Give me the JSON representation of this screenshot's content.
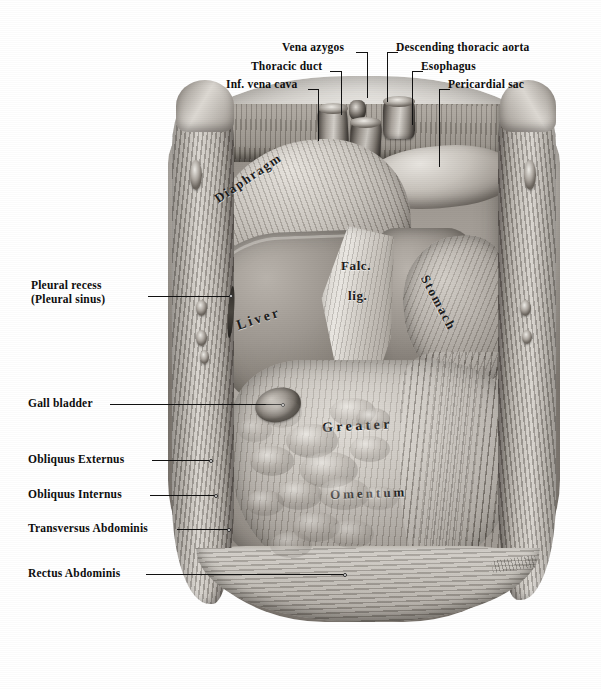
{
  "plate": {
    "title": "Abdominal cavity, anterior view with body wall reflected",
    "medium": "halftone anatomical engraving",
    "background_color": "#ffffff",
    "ink_color": "#111111"
  },
  "callouts": [
    {
      "id": "vena-azygos",
      "text": "Vena azygos",
      "align": "right",
      "x": 282,
      "y": 40,
      "lead": {
        "h_x": 356,
        "h_y": 52,
        "h_w": 12,
        "v_x": 367,
        "v_y": 52,
        "v_h": 46
      }
    },
    {
      "id": "thoracic-duct",
      "text": "Thoracic duct",
      "align": "right",
      "x": 251,
      "y": 59,
      "lead": {
        "h_x": 330,
        "h_y": 71,
        "h_w": 12,
        "v_x": 341,
        "v_y": 71,
        "v_h": 44
      }
    },
    {
      "id": "inf-vena-cava",
      "text": "Inf. vena cava",
      "align": "right",
      "x": 226,
      "y": 77,
      "lead": {
        "h_x": 308,
        "h_y": 89,
        "h_w": 11,
        "v_x": 318,
        "v_y": 89,
        "v_h": 52
      }
    },
    {
      "id": "descending-thoracic-aorta",
      "text": "Descending thoracic aorta",
      "align": "left",
      "x": 396,
      "y": 40,
      "lead": {
        "h_x": 387,
        "h_y": 52,
        "h_w": 11,
        "v_x": 387,
        "v_y": 52,
        "v_h": 50
      }
    },
    {
      "id": "esophagus",
      "text": "Esophagus",
      "align": "left",
      "x": 421,
      "y": 59,
      "lead": {
        "h_x": 412,
        "h_y": 71,
        "h_w": 11,
        "v_x": 412,
        "v_y": 71,
        "v_h": 54
      }
    },
    {
      "id": "pericardial-sac",
      "text": "Pericardial sac",
      "align": "left",
      "x": 448,
      "y": 77,
      "lead": {
        "h_x": 439,
        "h_y": 89,
        "h_w": 11,
        "v_x": 439,
        "v_y": 89,
        "v_h": 78
      }
    },
    {
      "id": "pleural-recess",
      "text": "Pleural recess\n(Pleural sinus)",
      "align": "right",
      "x": 31,
      "y": 278,
      "lead": {
        "h_x": 148,
        "h_y": 296,
        "h_w": 82,
        "dot_x": 229,
        "dot_y": 294
      }
    },
    {
      "id": "gall-bladder",
      "text": "Gall bladder",
      "align": "right",
      "x": 28,
      "y": 396,
      "lead": {
        "h_x": 110,
        "h_y": 404,
        "h_w": 172,
        "dot_x": 281,
        "dot_y": 403
      }
    },
    {
      "id": "obliquus-externus",
      "text": "Obliquus Externus",
      "align": "right",
      "x": 28,
      "y": 452,
      "lead": {
        "h_x": 152,
        "h_y": 460,
        "h_w": 58,
        "dot_x": 209,
        "dot_y": 459
      }
    },
    {
      "id": "obliquus-internus",
      "text": "Obliquus Internus",
      "align": "right",
      "x": 28,
      "y": 487,
      "lead": {
        "h_x": 150,
        "h_y": 495,
        "h_w": 65,
        "dot_x": 214,
        "dot_y": 494
      }
    },
    {
      "id": "transversus-abdominis",
      "text": "Transversus Abdominis",
      "align": "right",
      "x": 28,
      "y": 521,
      "lead": {
        "h_x": 177,
        "h_y": 529,
        "h_w": 51,
        "dot_x": 227,
        "dot_y": 528
      }
    },
    {
      "id": "rectus-abdominis",
      "text": "Rectus Abdominis",
      "align": "right",
      "x": 28,
      "y": 566,
      "lead": {
        "h_x": 146,
        "h_y": 574,
        "h_w": 198,
        "dot_x": 343,
        "dot_y": 573
      }
    }
  ],
  "plate_captions": [
    {
      "id": "diaphragm",
      "text": "Diaphragm",
      "x": 216,
      "y": 192,
      "size": 13,
      "rotate": -34,
      "spacing": 1.6
    },
    {
      "id": "falc",
      "text": "Falc.",
      "x": 341,
      "y": 258,
      "size": 13,
      "rotate": 0,
      "spacing": 0.6
    },
    {
      "id": "lig",
      "text": "lig.",
      "x": 348,
      "y": 288,
      "size": 13,
      "rotate": 0,
      "spacing": 0.6
    },
    {
      "id": "liver",
      "text": "Liver",
      "x": 237,
      "y": 318,
      "size": 14,
      "rotate": -18,
      "spacing": 2.6
    },
    {
      "id": "stomach",
      "text": "Stomach",
      "x": 424,
      "y": 268,
      "size": 13,
      "rotate": 62,
      "spacing": 1.8
    },
    {
      "id": "greater",
      "text": "Greater",
      "x": 322,
      "y": 420,
      "size": 14,
      "rotate": -3,
      "spacing": 3.4
    },
    {
      "id": "omentum",
      "text": "Omentum",
      "x": 330,
      "y": 487,
      "size": 13,
      "rotate": -2,
      "spacing": 3.0
    }
  ]
}
